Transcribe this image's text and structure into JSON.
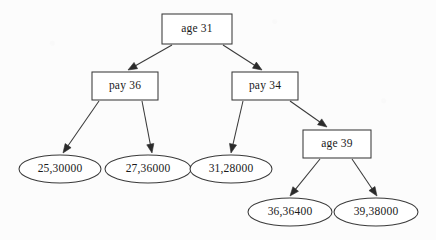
{
  "diagram": {
    "type": "decision-tree",
    "title": "",
    "background_color": "#fcfcfc",
    "stroke_color": "#3a3a3a",
    "text_color": "#1a1a1a",
    "internal_nodes": [
      {
        "id": "root",
        "label": "age 31",
        "shape": "rectangle",
        "x": 162,
        "y": 14,
        "width": 70,
        "height": 30,
        "level": 0
      },
      {
        "id": "pay36",
        "label": "pay 36",
        "shape": "rectangle",
        "x": 92,
        "y": 72,
        "width": 66,
        "height": 28,
        "level": 1
      },
      {
        "id": "pay34",
        "label": "pay 34",
        "shape": "rectangle",
        "x": 232,
        "y": 72,
        "width": 66,
        "height": 28,
        "level": 1
      },
      {
        "id": "age39",
        "label": "age 39",
        "shape": "rectangle",
        "x": 303,
        "y": 130,
        "width": 68,
        "height": 28,
        "level": 2
      }
    ],
    "leaf_nodes": [
      {
        "id": "leaf1",
        "label": "25,30000",
        "shape": "ellipse",
        "cx": 60,
        "cy": 169,
        "rx": 41,
        "ry": 14,
        "age": "25",
        "pay": "30000"
      },
      {
        "id": "leaf2",
        "label": "27,36000",
        "shape": "ellipse",
        "cx": 148,
        "cy": 169,
        "rx": 43,
        "ry": 14,
        "age": "27",
        "pay": "36000"
      },
      {
        "id": "leaf3",
        "label": "31,28000",
        "shape": "ellipse",
        "cx": 231,
        "cy": 169,
        "rx": 41,
        "ry": 14,
        "age": "31",
        "pay": "28000"
      },
      {
        "id": "leaf4",
        "label": "36,36400",
        "shape": "ellipse",
        "cx": 290,
        "cy": 212,
        "rx": 42,
        "ry": 14,
        "age": "36",
        "pay": "36400"
      },
      {
        "id": "leaf5",
        "label": "39,38000",
        "shape": "ellipse",
        "cx": 376,
        "cy": 212,
        "rx": 42,
        "ry": 14,
        "age": "39",
        "pay": "38000"
      }
    ],
    "edges": [
      {
        "id": "e1",
        "from": "root",
        "to": "pay36",
        "x1": 172,
        "y1": 45,
        "x2": 128,
        "y2": 70
      },
      {
        "id": "e2",
        "from": "root",
        "to": "pay34",
        "x1": 223,
        "y1": 45,
        "x2": 262,
        "y2": 70
      },
      {
        "id": "e3",
        "from": "pay36",
        "to": "leaf1",
        "x1": 99,
        "y1": 101,
        "x2": 63,
        "y2": 153
      },
      {
        "id": "e4",
        "from": "pay36",
        "to": "leaf2",
        "x1": 142,
        "y1": 101,
        "x2": 152,
        "y2": 153
      },
      {
        "id": "e5",
        "from": "pay34",
        "to": "leaf3",
        "x1": 243,
        "y1": 101,
        "x2": 231,
        "y2": 153
      },
      {
        "id": "e6",
        "from": "pay34",
        "to": "age39",
        "x1": 290,
        "y1": 101,
        "x2": 327,
        "y2": 127
      },
      {
        "id": "e7",
        "from": "age39",
        "to": "leaf4",
        "x1": 320,
        "y1": 159,
        "x2": 290,
        "y2": 196
      },
      {
        "id": "e8",
        "from": "age39",
        "to": "leaf5",
        "x1": 352,
        "y1": 159,
        "x2": 377,
        "y2": 196
      }
    ]
  }
}
